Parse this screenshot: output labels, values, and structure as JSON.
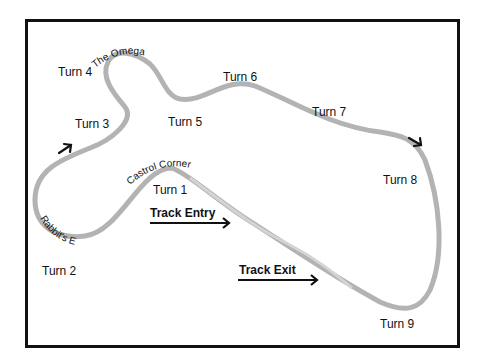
{
  "map": {
    "title": "Race track map",
    "track_color": "#b3b3b3",
    "border_color": "#111111",
    "turns": [
      {
        "id": "turn-1",
        "label": "Turn 1"
      },
      {
        "id": "turn-2",
        "label": "Turn 2"
      },
      {
        "id": "turn-3",
        "label": "Turn 3"
      },
      {
        "id": "turn-4",
        "label": "Turn 4"
      },
      {
        "id": "turn-5",
        "label": "Turn 5"
      },
      {
        "id": "turn-6",
        "label": "Turn 6"
      },
      {
        "id": "turn-7",
        "label": "Turn 7"
      },
      {
        "id": "turn-8",
        "label": "Turn 8"
      },
      {
        "id": "turn-9",
        "label": "Turn 9"
      }
    ],
    "named_corners": {
      "omega": "The Omega",
      "castrol": "Castrol Corner",
      "rabbits_ear": "Rabbit's Ear"
    },
    "track_entry": "Track Entry",
    "track_exit": "Track Exit",
    "direction_arrows": [
      "direction-arrow-left",
      "direction-arrow-right"
    ]
  }
}
